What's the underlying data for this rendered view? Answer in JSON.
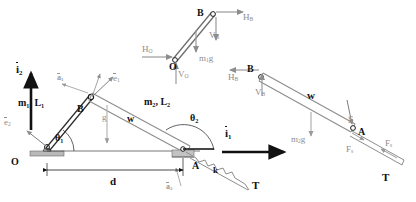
{
  "figure": {
    "type": "engineering-mechanics-diagram",
    "colors": {
      "stroke_dark": "#1a1a1a",
      "stroke_grey": "#8d8d8d",
      "fill_light": "#d6d6d6",
      "text_dark": "#111111",
      "text_grey": "#8d8d8d",
      "background": "#ffffff"
    }
  },
  "labels": {
    "i2": "i",
    "i2_sub": "2",
    "i1": "i",
    "i1_sub": "1",
    "e1": "e",
    "e1_sub": "1",
    "e2": "e",
    "e2_sub": "2",
    "a1": "a",
    "a1_sub": "1",
    "a2": "a",
    "a2_sub": "2",
    "m1L1": "m",
    "m1L1_sub1": "1",
    "m1L1_mid": ", L",
    "m1L1_sub2": "1",
    "m2L2": "m",
    "m2L2_sub1": "2",
    "m2L2_mid": ", L",
    "m2L2_sub2": "2",
    "theta1": "θ",
    "theta1_sub": "1",
    "theta2": "θ",
    "theta2_sub": "2",
    "point_O": "O",
    "point_B": "B",
    "point_A": "A",
    "w": "w",
    "g": "g",
    "d": "d",
    "k": "k",
    "T": "T",
    "S": "S",
    "HO": "H",
    "HO_sub": "O",
    "VO": "V",
    "VO_sub": "O",
    "HB": "H",
    "HB_sub": "B",
    "VB": "V",
    "VB_sub": "B",
    "m1g": "m",
    "m1g_sub": "1",
    "m1g_tail": "g",
    "m2g": "m",
    "m2g_sub": "2",
    "m2g_tail": "g",
    "Fs": "F",
    "Fs_sub": "s"
  },
  "panels": {
    "main": {
      "name": "assembled-mechanism",
      "point_O_label": "O",
      "point_B_label": "B",
      "point_A_label": "A",
      "link1_label": "m₁, L₁",
      "link2_label": "m₂, L₂",
      "angle1_label": "θ₁",
      "angle2_label": "θ₂",
      "span_label": "d",
      "spring_label": "k",
      "tension_label": "T",
      "width_label": "w",
      "gravity_label": "g"
    },
    "fbd_link1": {
      "name": "free-body-diagram-link-1",
      "point_O_label": "O",
      "point_B_label": "B",
      "reaction_HO": "Hₒ",
      "reaction_VO": "Vₒ",
      "reaction_HB": "Hʙ",
      "reaction_VB": "Vʙ",
      "weight": "m₁g"
    },
    "fbd_link2": {
      "name": "free-body-diagram-link-2",
      "point_B_label": "B",
      "point_A_label": "A",
      "reaction_HB": "Hʙ",
      "reaction_VB": "Vʙ",
      "weight": "m₂g",
      "width_label": "w",
      "normal_label": "S",
      "spring_force": "Fₛ",
      "tension_label": "T"
    }
  }
}
